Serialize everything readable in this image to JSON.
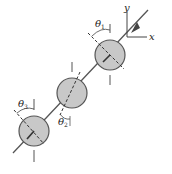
{
  "diagram": {
    "type": "shaft-with-three-disks",
    "colors": {
      "disk_fill": "#c8c8c8",
      "stroke": "#555555",
      "line": "#444444",
      "background": "#ffffff"
    },
    "axes": {
      "x_label": "x",
      "y_label": "y"
    },
    "disks": [
      {
        "id": 1,
        "angle_label": "θ",
        "angle_sub": "1"
      },
      {
        "id": 2,
        "angle_label": "θ",
        "angle_sub": "2"
      },
      {
        "id": 3,
        "angle_label": "θ",
        "angle_sub": "3"
      }
    ]
  }
}
